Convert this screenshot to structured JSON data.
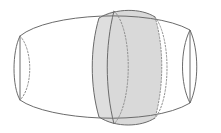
{
  "figure": {
    "caption": "",
    "canvas": {
      "width": 221,
      "height": 133,
      "background": "#ffffff"
    },
    "style": {
      "stroke_solid": "#6b6b6b",
      "stroke_dotted": "#8e8e8e",
      "shade_fill": "#d9d9d9",
      "shade_fill_light": "#e3e3e3",
      "stroke_width": "1",
      "dash_pattern": "1.6 1.8"
    },
    "parts": [
      {
        "name": "outer-silhouette",
        "label": "Barrel outline",
        "kind": "outline",
        "stroke": "#6b6b6b",
        "dashed": false,
        "path": "M 20 36 C 48 13 150 8 190 30 L 190 103 C 150 127 48 120 20 100 Z"
      },
      {
        "name": "left-cap-front-arc",
        "label": "Left end cap visible arc",
        "kind": "arc",
        "stroke": "#6b6b6b",
        "dashed": false,
        "path": "M 20 36 C 12 52 12 86 20 100"
      },
      {
        "name": "left-cap-hidden-arc",
        "label": "Left end cap hidden arc",
        "kind": "arc",
        "stroke": "#8e8e8e",
        "dashed": true,
        "path": "M 20 36 C 33 50 33 87 20 100"
      },
      {
        "name": "right-cap-front-arc",
        "label": "Right end cap visible arc",
        "kind": "arc",
        "stroke": "#6b6b6b",
        "dashed": false,
        "path": "M 190 30 C 199 50 199 84 190 103"
      },
      {
        "name": "right-cap-back-arc",
        "label": "Right end cap rear arc",
        "kind": "arc",
        "stroke": "#6b6b6b",
        "dashed": false,
        "path": "M 190 30 C 180 50 180 84 190 103"
      },
      {
        "name": "slab-body",
        "label": "Shaded cross-section slab",
        "kind": "filled-region",
        "fill": "#d9d9d9",
        "stroke": "#6b6b6b",
        "dashed": false,
        "path": "M 99 18 C 90 48 90 86 99 117 C 116 128 141 127 155 118 C 164 86 164 47 155 17 C 141 8 116 8 99 18 Z"
      },
      {
        "name": "slab-front-face-ellipse",
        "label": "Front circular face of slab",
        "kind": "arc",
        "stroke": "#6b6b6b",
        "dashed": false,
        "path": "M 99 18 C 116 8 141 8 155 17"
      },
      {
        "name": "slab-front-face-left-edge",
        "label": "Front face left silhouette",
        "kind": "arc",
        "stroke": "#6b6b6b",
        "dashed": false,
        "path": "M 99 18 C 90 48 90 86 99 117"
      },
      {
        "name": "slab-mid-ellipse-front",
        "label": "Front face ellipse near edge",
        "kind": "arc",
        "stroke": "#6b6b6b",
        "dashed": false,
        "path": "M 114 11 C 105 46 105 88 114 124"
      },
      {
        "name": "slab-back-ellipse-dotted-inner",
        "label": "Hidden rear ellipse of slab front face",
        "kind": "arc",
        "stroke": "#8e8e8e",
        "dashed": true,
        "path": "M 114 11 C 133 29 133 104 114 124"
      },
      {
        "name": "slab-back-ellipse-dotted-outer",
        "label": "Hidden rear ellipse of slab back face",
        "kind": "arc",
        "stroke": "#8e8e8e",
        "dashed": true,
        "path": "M 155 17 C 171 37 171 99 155 118"
      },
      {
        "name": "slab-back-face-right-edge",
        "label": "Back face right silhouette",
        "kind": "arc",
        "stroke": "#8e8e8e",
        "dashed": true,
        "path": "M 155 17 C 164 47 164 86 155 118"
      },
      {
        "name": "slab-bottom-edge",
        "label": "Slab bottom edge",
        "kind": "arc",
        "stroke": "#6b6b6b",
        "dashed": false,
        "path": "M 99 117 C 116 128 141 127 155 118"
      }
    ]
  }
}
